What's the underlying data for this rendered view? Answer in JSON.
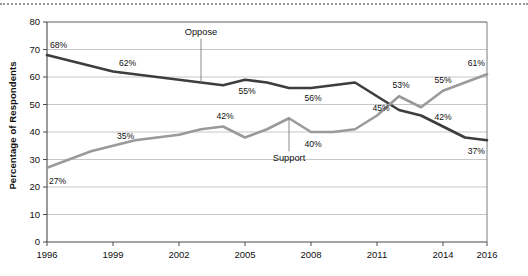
{
  "chart_data": {
    "type": "line",
    "title": "",
    "xlabel": "",
    "ylabel": "Percentage of Respondents",
    "ylim": [
      0,
      80
    ],
    "ytick_labels": [
      "0",
      "10",
      "20",
      "30",
      "40",
      "50",
      "60",
      "70",
      "80"
    ],
    "ytick_values": [
      0,
      10,
      20,
      30,
      40,
      50,
      60,
      70,
      80
    ],
    "xlim": [
      1996,
      2016
    ],
    "xtick_labels": [
      "1996",
      "1999",
      "2002",
      "2005",
      "2008",
      "2011",
      "2014",
      "2016"
    ],
    "xtick_values": [
      1996,
      1999,
      2002,
      2005,
      2008,
      2011,
      2014,
      2016
    ],
    "grid": true,
    "legend_position": "inline-annotations",
    "x": [
      1996,
      1997,
      1998,
      1999,
      2000,
      2001,
      2002,
      2003,
      2004,
      2005,
      2006,
      2007,
      2008,
      2009,
      2010,
      2011,
      2012,
      2013,
      2014,
      2015,
      2016
    ],
    "series": [
      {
        "name": "Oppose",
        "color": "#3d3d3d",
        "values": [
          68,
          66,
          64,
          62,
          61,
          60,
          59,
          58,
          57,
          59,
          58,
          56,
          56,
          57,
          58,
          53,
          48,
          46,
          42,
          38,
          37
        ],
        "point_labels": [
          {
            "x": 1996,
            "text": "68%"
          },
          {
            "x": 1999,
            "text": "62%"
          },
          {
            "x": 2005,
            "text": "55%"
          },
          {
            "x": 2008,
            "text": "56%"
          },
          {
            "x": 2011,
            "text": "45%"
          },
          {
            "x": 2014,
            "text": "42%"
          },
          {
            "x": 2016,
            "text": "37%"
          }
        ]
      },
      {
        "name": "Support",
        "color": "#9a9a9a",
        "values": [
          27,
          30,
          33,
          35,
          37,
          38,
          39,
          41,
          42,
          38,
          41,
          45,
          40,
          40,
          41,
          46,
          53,
          49,
          55,
          58,
          61
        ],
        "point_labels": [
          {
            "x": 1996,
            "text": "27%"
          },
          {
            "x": 1999,
            "text": "35%"
          },
          {
            "x": 2004,
            "text": "42%"
          },
          {
            "x": 2008,
            "text": "40%"
          },
          {
            "x": 2012,
            "text": "53%"
          },
          {
            "x": 2014,
            "text": "55%"
          },
          {
            "x": 2016,
            "text": "61%"
          }
        ]
      }
    ],
    "annotations": [
      {
        "name": "oppose",
        "text": "Oppose",
        "target_x": 2003,
        "target_y": 58
      },
      {
        "name": "support",
        "text": "Support",
        "target_x": 2007,
        "target_y": 45
      }
    ]
  }
}
